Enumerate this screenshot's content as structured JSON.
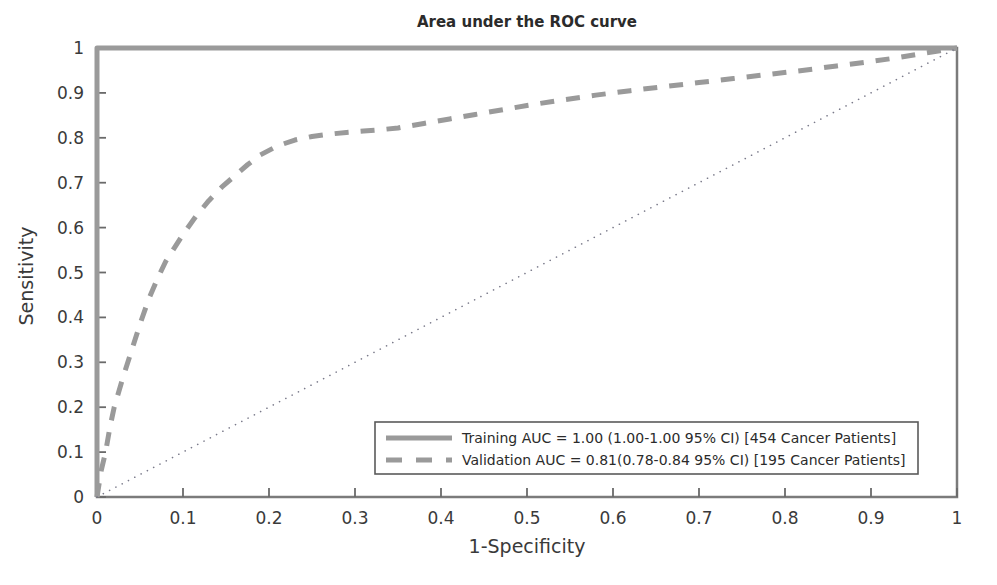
{
  "chart_data": {
    "type": "line",
    "title": "Area under the ROC curve",
    "xlabel": "1-Specificity",
    "ylabel": "Sensitivity",
    "xlim": [
      0,
      1
    ],
    "ylim": [
      0,
      1
    ],
    "grid": false,
    "legend_position": "lower-right",
    "xticks": [
      "0",
      "0.1",
      "0.2",
      "0.3",
      "0.4",
      "0.5",
      "0.6",
      "0.7",
      "0.8",
      "0.9",
      "1"
    ],
    "xtick_values": [
      0,
      0.1,
      0.2,
      0.3,
      0.4,
      0.5,
      0.6,
      0.7,
      0.8,
      0.9,
      1
    ],
    "yticks": [
      "0",
      "0.1",
      "0.2",
      "0.3",
      "0.4",
      "0.5",
      "0.6",
      "0.7",
      "0.8",
      "0.9",
      "1"
    ],
    "ytick_values": [
      0,
      0.1,
      0.2,
      0.3,
      0.4,
      0.5,
      0.6,
      0.7,
      0.8,
      0.9,
      1
    ],
    "series": [
      {
        "name": "Training",
        "legend_label": "Training AUC = 1.00 (1.00-1.00 95% CI) [454 Cancer Patients]",
        "auc": 1.0,
        "ci_low": 1.0,
        "ci_high": 1.0,
        "ci_level": "95% CI",
        "n_patients": 454,
        "style": "solid",
        "color": "#9a9a9a",
        "width": 5,
        "x": [
          0,
          0,
          1
        ],
        "y": [
          0,
          1,
          1
        ]
      },
      {
        "name": "Validation",
        "legend_label": "Validation AUC = 0.81(0.78-0.84 95% CI) [195 Cancer Patients]",
        "auc": 0.81,
        "ci_low": 0.78,
        "ci_high": 0.84,
        "ci_level": "95% CI",
        "n_patients": 195,
        "style": "dashed",
        "color": "#9a9a9a",
        "width": 5,
        "x": [
          0,
          0.005,
          0.01,
          0.015,
          0.02,
          0.03,
          0.04,
          0.05,
          0.06,
          0.07,
          0.08,
          0.09,
          0.1,
          0.115,
          0.13,
          0.145,
          0.16,
          0.175,
          0.19,
          0.21,
          0.23,
          0.25,
          0.27,
          0.29,
          0.31,
          0.33,
          0.35,
          0.38,
          0.41,
          0.44,
          0.47,
          0.5,
          0.54,
          0.58,
          0.62,
          0.66,
          0.7,
          0.74,
          0.78,
          0.82,
          0.86,
          0.9,
          0.93,
          0.96,
          0.98,
          1.0
        ],
        "y": [
          0,
          0.06,
          0.1,
          0.155,
          0.2,
          0.265,
          0.325,
          0.385,
          0.44,
          0.485,
          0.525,
          0.555,
          0.585,
          0.625,
          0.66,
          0.69,
          0.715,
          0.74,
          0.762,
          0.782,
          0.795,
          0.803,
          0.808,
          0.812,
          0.815,
          0.818,
          0.822,
          0.832,
          0.842,
          0.852,
          0.862,
          0.872,
          0.884,
          0.895,
          0.905,
          0.914,
          0.923,
          0.932,
          0.941,
          0.95,
          0.96,
          0.97,
          0.978,
          0.988,
          0.994,
          1.0
        ]
      },
      {
        "name": "Reference diagonal",
        "legend_label": "",
        "style": "dotted",
        "color": "#7a7a8a",
        "width": 1.6,
        "x": [
          0,
          1
        ],
        "y": [
          0,
          1
        ]
      }
    ]
  },
  "figure": {
    "title": "Area under the ROC curve",
    "axis": {
      "x_label": "1-Specificity",
      "y_label": "Sensitivity"
    },
    "legend": {
      "items": [
        {
          "label": "Training AUC = 1.00 (1.00-1.00 95% CI) [454 Cancer Patients]",
          "style": "solid",
          "color": "#9a9a9a"
        },
        {
          "label": "Validation AUC = 0.81(0.78-0.84 95% CI) [195 Cancer Patients]",
          "style": "dashed",
          "color": "#9a9a9a"
        }
      ]
    },
    "colors": {
      "curve": "#9a9a9a",
      "frame": "#7b7b7b",
      "diagonal": "#7a7a8a",
      "text": "#2b2b2b",
      "background": "#ffffff"
    }
  }
}
